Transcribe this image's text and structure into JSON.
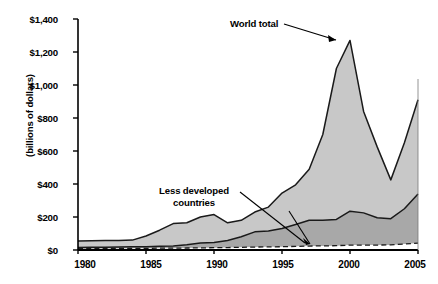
{
  "chart_data": {
    "type": "area",
    "title": "",
    "subtitle": "",
    "xlabel": "",
    "ylabel": "(billions of dollars)",
    "xlim": [
      1980,
      2005
    ],
    "ylim": [
      0,
      1400
    ],
    "grid": false,
    "legend_position": "inline-annotations",
    "x_ticks": [
      "1980",
      "1985",
      "1990",
      "1995",
      "2000",
      "2005"
    ],
    "y_ticks": [
      "$0",
      "$200",
      "$400",
      "$600",
      "$800",
      "$1,000",
      "$1,200",
      "$1,400"
    ],
    "x": [
      1980,
      1981,
      1982,
      1983,
      1984,
      1985,
      1986,
      1987,
      1988,
      1989,
      1990,
      1991,
      1992,
      1993,
      1994,
      1995,
      1996,
      1997,
      1998,
      1999,
      2000,
      2001,
      2002,
      2003,
      2004,
      2005
    ],
    "series": [
      {
        "name": "World total",
        "style": "solid-upper-boundary",
        "values": [
          55,
          56,
          57,
          58,
          60,
          85,
          120,
          160,
          165,
          200,
          215,
          165,
          180,
          230,
          260,
          345,
          395,
          490,
          700,
          1100,
          1270,
          840,
          625,
          425,
          650,
          910
        ]
      },
      {
        "name": "Less developed countries",
        "style": "solid-lower-boundary",
        "values": [
          15,
          16,
          17,
          18,
          19,
          20,
          22,
          25,
          32,
          42,
          45,
          58,
          80,
          110,
          115,
          130,
          155,
          180,
          180,
          185,
          235,
          225,
          195,
          190,
          250,
          340
        ]
      },
      {
        "name": "Developing countries",
        "style": "dashed",
        "values": [
          8,
          8,
          9,
          9,
          10,
          10,
          11,
          11,
          12,
          13,
          14,
          15,
          16,
          18,
          19,
          20,
          22,
          24,
          25,
          26,
          30,
          30,
          30,
          31,
          36,
          42
        ]
      }
    ],
    "bands": [
      {
        "name": "Developed countries",
        "between": [
          "Less developed countries",
          "World total"
        ],
        "fill": "#c8c8c8"
      },
      {
        "name": "Less developed countries band",
        "between": [
          "Developing countries",
          "Less developed countries"
        ],
        "fill": "#a8a8a8"
      }
    ],
    "annotations": [
      {
        "name": "world-total",
        "text": "World total",
        "lines": [
          "World total"
        ]
      },
      {
        "name": "less-developed-countries",
        "text": "Less developed countries",
        "lines": [
          "Less developed",
          "countries"
        ]
      },
      {
        "name": "developed-countries",
        "text": "Developed countries",
        "lines": [
          "Developed",
          "countries"
        ]
      },
      {
        "name": "developing-countries",
        "text": "Developing countries",
        "lines": [
          "Developing",
          "countries"
        ]
      }
    ],
    "colors": {
      "developed_band": "#c8c8c8",
      "less_developed_band": "#a8a8a8",
      "axis": "#000000",
      "line": "#1a1a1a"
    }
  },
  "y_axis": {
    "t0": "$0",
    "t1": "$200",
    "t2": "$400",
    "t3": "$600",
    "t4": "$800",
    "t5": "$1,000",
    "t6": "$1,200",
    "t7": "$1,400",
    "label": "(billions of dollars)"
  },
  "x_axis": {
    "t0": "1980",
    "t1": "1985",
    "t2": "1990",
    "t3": "1995",
    "t4": "2000",
    "t5": "2005"
  },
  "labels": {
    "world_total": "World total",
    "less_developed_1": "Less developed",
    "less_developed_2": "countries",
    "developed_1": "Developed",
    "developed_2": "countries",
    "developing_1": "Developing",
    "developing_2": "countries"
  }
}
